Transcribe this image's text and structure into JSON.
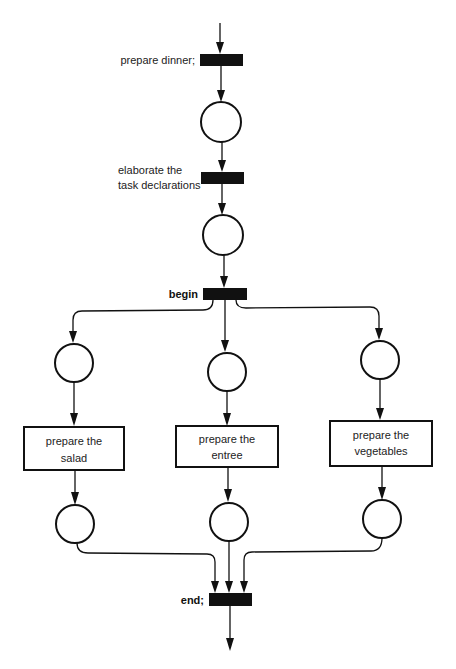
{
  "diagram": {
    "type": "petri-net",
    "transitions": [
      {
        "id": "t_prepare_dinner",
        "label": "prepare dinner;"
      },
      {
        "id": "t_elaborate",
        "label_lines": [
          "elaborate the",
          "task declarations"
        ]
      },
      {
        "id": "t_begin",
        "label": "begin"
      },
      {
        "id": "t_end",
        "label": "end;"
      }
    ],
    "tasks": [
      {
        "id": "task_salad",
        "label_lines": [
          "prepare the",
          "salad"
        ]
      },
      {
        "id": "task_entree",
        "label_lines": [
          "prepare the",
          "entree"
        ]
      },
      {
        "id": "task_vegetables",
        "label_lines": [
          "prepare the",
          "vegetables"
        ]
      }
    ],
    "places": [
      {
        "id": "p1"
      },
      {
        "id": "p2"
      },
      {
        "id": "p_salad_in"
      },
      {
        "id": "p_entree_in"
      },
      {
        "id": "p_veg_in"
      },
      {
        "id": "p_salad_out"
      },
      {
        "id": "p_entree_out"
      },
      {
        "id": "p_veg_out"
      }
    ],
    "colors": {
      "ink": "#111111",
      "background": "#ffffff"
    }
  }
}
